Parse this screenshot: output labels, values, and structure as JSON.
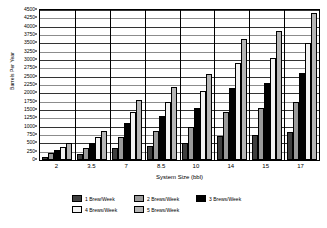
{
  "chart_data": {
    "type": "bar",
    "title": "",
    "xlabel": "System Size (bbl)",
    "ylabel": "Barrels Per Year",
    "categories": [
      "2",
      "3.5",
      "7",
      "8.5",
      "10",
      "14",
      "15",
      "17"
    ],
    "ylim": [
      0,
      4500
    ],
    "ytick_step": 250,
    "yticks": [
      "0",
      "250",
      "500",
      "750",
      "1000",
      "1250",
      "1500",
      "1750",
      "2000",
      "2250",
      "2500",
      "2750",
      "3000",
      "3250",
      "3500",
      "3750",
      "4000",
      "4250",
      "4500"
    ],
    "grid": true,
    "legend_position": "bottom",
    "series": [
      {
        "name": "1 Brew/Week",
        "color": "#3f3f3f",
        "values": [
          100,
          175,
          350,
          425,
          500,
          725,
          750,
          850
        ]
      },
      {
        "name": "2 Brews/Week",
        "color": "#9a9a9a",
        "values": [
          200,
          350,
          700,
          875,
          1000,
          1450,
          1550,
          1750
        ]
      },
      {
        "name": "3 Brews/Week",
        "color": "#000000",
        "values": [
          300,
          525,
          1100,
          1325,
          1550,
          2150,
          2325,
          2625
        ]
      },
      {
        "name": "4 Brews/Week",
        "color": "#f2f2f2",
        "values": [
          400,
          700,
          1450,
          1750,
          2075,
          2900,
          3075,
          3500
        ]
      },
      {
        "name": "5 Brews/Week",
        "color": "#b5b5b5",
        "values": [
          500,
          875,
          1800,
          2200,
          2575,
          3625,
          3875,
          4400
        ]
      }
    ]
  },
  "axes": {
    "y_title": "Barrels Per Year",
    "x_title": "System Size (bbl)"
  },
  "legend": {
    "items": [
      {
        "label": "1 Brew/Week"
      },
      {
        "label": "2 Brews/Week"
      },
      {
        "label": "3 Brews/Week"
      },
      {
        "label": "4 Brews/Week"
      },
      {
        "label": "5 Brews/Week"
      }
    ]
  }
}
